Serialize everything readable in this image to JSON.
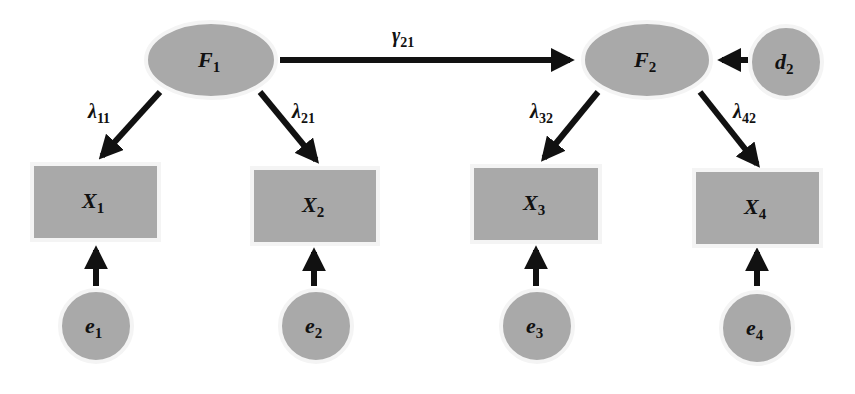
{
  "diagram": {
    "type": "structural-equation-model",
    "colors": {
      "node_fill": "#a9a9a9",
      "edge": "#111111",
      "background": "#ffffff"
    },
    "latent_factors": [
      {
        "id": "F1",
        "base": "F",
        "sub": "1"
      },
      {
        "id": "F2",
        "base": "F",
        "sub": "2"
      }
    ],
    "disturbance": {
      "id": "d2",
      "base": "d",
      "sub": "2"
    },
    "indicators": [
      {
        "id": "X1",
        "base": "X",
        "sub": "1"
      },
      {
        "id": "X2",
        "base": "X",
        "sub": "2"
      },
      {
        "id": "X3",
        "base": "X",
        "sub": "3"
      },
      {
        "id": "X4",
        "base": "X",
        "sub": "4"
      }
    ],
    "errors": [
      {
        "id": "e1",
        "base": "e",
        "sub": "1"
      },
      {
        "id": "e2",
        "base": "e",
        "sub": "2"
      },
      {
        "id": "e3",
        "base": "e",
        "sub": "3"
      },
      {
        "id": "e4",
        "base": "e",
        "sub": "4"
      }
    ],
    "paths": [
      {
        "from": "F1",
        "to": "F2",
        "base": "γ",
        "sub": "21"
      },
      {
        "from": "F1",
        "to": "X1",
        "base": "λ",
        "sub": "11"
      },
      {
        "from": "F1",
        "to": "X2",
        "base": "λ",
        "sub": "21"
      },
      {
        "from": "F2",
        "to": "X3",
        "base": "λ",
        "sub": "32"
      },
      {
        "from": "F2",
        "to": "X4",
        "base": "λ",
        "sub": "42"
      },
      {
        "from": "d2",
        "to": "F2",
        "base": "",
        "sub": ""
      },
      {
        "from": "e1",
        "to": "X1",
        "base": "",
        "sub": ""
      },
      {
        "from": "e2",
        "to": "X2",
        "base": "",
        "sub": ""
      },
      {
        "from": "e3",
        "to": "X3",
        "base": "",
        "sub": ""
      },
      {
        "from": "e4",
        "to": "X4",
        "base": "",
        "sub": ""
      }
    ]
  }
}
